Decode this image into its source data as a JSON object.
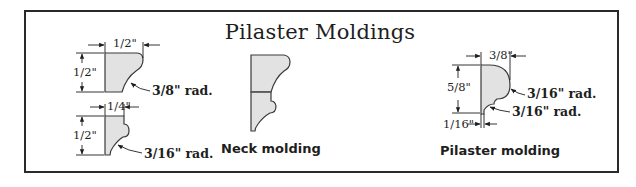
{
  "title": "Pilaster Moldings",
  "colors": {
    "fill": "#e2e2e2",
    "stroke": "#3a3a3a",
    "frame": "#2a2a2a"
  },
  "moldings": {
    "top_left": {
      "width_label": "1/2\"",
      "height_label": "1/2\"",
      "radius_label": "3/8\" rad."
    },
    "bottom_left": {
      "width_label": "1/4\"",
      "height_label": "1/2\"",
      "radius_label": "3/16\" rad."
    },
    "neck": {
      "caption": "Neck molding"
    },
    "pilaster": {
      "width_label": "3/8\"",
      "height_label": "5/8\"",
      "offset_label": "1/16\"",
      "radius_upper_label": "3/16\" rad.",
      "radius_lower_label": "3/16\" rad.",
      "caption": "Pilaster molding"
    }
  }
}
